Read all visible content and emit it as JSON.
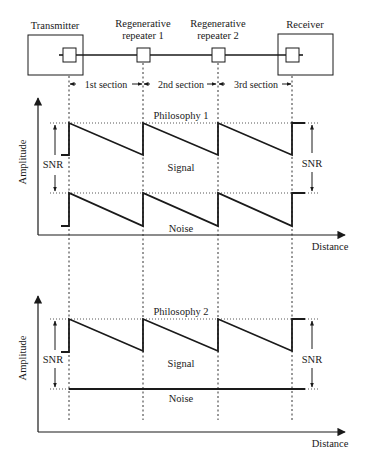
{
  "link": {
    "nodes": [
      {
        "id": "transmitter",
        "label": "Transmitter"
      },
      {
        "id": "repeater1",
        "label_line1": "Regenerative",
        "label_line2": "repeater 1"
      },
      {
        "id": "repeater2",
        "label_line1": "Regenerative",
        "label_line2": "repeater 2"
      },
      {
        "id": "receiver",
        "label": "Receiver"
      }
    ],
    "sections": [
      "1st section",
      "2nd section",
      "3rd section"
    ]
  },
  "plot1": {
    "title": "Philosophy 1",
    "y_label": "Amplitude",
    "x_label": "Distance",
    "snr_left": "SNR",
    "snr_right": "SNR",
    "signal_label": "Signal",
    "noise_label": "Noise"
  },
  "plot2": {
    "title": "Philosophy 2",
    "y_label": "Amplitude",
    "x_label": "Distance",
    "snr_left": "SNR",
    "snr_right": "SNR",
    "signal_label": "Signal",
    "noise_label": "Noise"
  }
}
